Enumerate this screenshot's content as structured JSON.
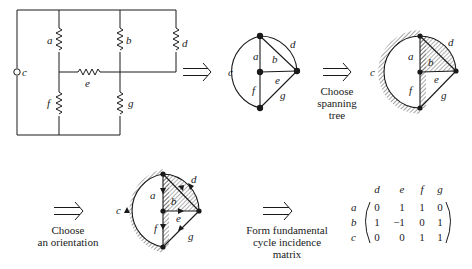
{
  "circuit": {
    "node_label": "c",
    "resistors": [
      "a",
      "b",
      "d",
      "e",
      "f",
      "g"
    ]
  },
  "graph_labels": {
    "a": "a",
    "b": "b",
    "c": "c",
    "d": "d",
    "e": "e",
    "f": "f",
    "g": "g"
  },
  "steps": [
    {
      "lines": []
    },
    {
      "lines": [
        "Choose",
        "spanning",
        "tree"
      ]
    },
    {
      "lines": [
        "Choose",
        "an orientation"
      ]
    },
    {
      "lines": [
        "Form fundamental",
        "cycle incidence",
        "matrix"
      ]
    }
  ],
  "matrix": {
    "col_headers": [
      "d",
      "e",
      "f",
      "g"
    ],
    "row_headers": [
      "a",
      "b",
      "c"
    ],
    "rows": [
      [
        "0",
        "1",
        "1",
        "0"
      ],
      [
        "1",
        "−1",
        "0",
        "1"
      ],
      [
        "0",
        "0",
        "1",
        "1"
      ]
    ]
  },
  "colors": {
    "ink": "#1a1a1a",
    "background": "#ffffff"
  }
}
